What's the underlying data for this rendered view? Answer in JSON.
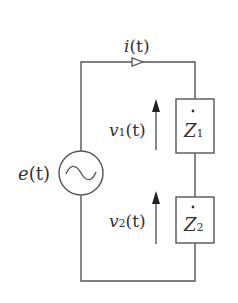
{
  "diagram": {
    "type": "series AC circuit",
    "colors": {
      "wire": "#555555",
      "text": "#333333",
      "background": "#ffffff"
    },
    "current": {
      "label": "i(t)",
      "symbol": "i",
      "arg": "(t)"
    },
    "source": {
      "label": "e(t)",
      "symbol": "e",
      "arg": "(t)",
      "icon": "ac-source-icon"
    },
    "impedances": [
      {
        "symbol": "Z",
        "sub": "1",
        "label": "Ż1"
      },
      {
        "symbol": "Z",
        "sub": "2",
        "label": "Ż2"
      }
    ],
    "voltages": [
      {
        "symbol": "v",
        "sub": "1",
        "arg": "(t)",
        "label": "v1(t)"
      },
      {
        "symbol": "v",
        "sub": "2",
        "arg": "(t)",
        "label": "v2(t)"
      }
    ]
  }
}
